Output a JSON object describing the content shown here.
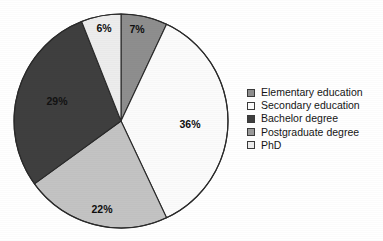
{
  "chart_data": {
    "type": "pie",
    "title": "",
    "subtitle": "",
    "xlabel": "",
    "ylabel": "",
    "legend_position": "right",
    "grid": false,
    "categories": [
      "Elementary education",
      "Secondary education",
      "Bachelor degree",
      "Postgraduate degree",
      "PhD"
    ],
    "values": [
      7,
      36,
      29,
      22,
      6
    ],
    "value_labels": [
      "7%",
      "36%",
      "29%",
      "22%",
      "6%"
    ],
    "colors": [
      "#8e8e8e",
      "#fbfbfb",
      "#3f3f3f",
      "#c3c3c3",
      "#ededed"
    ],
    "slice_order_clockwise_from_top": [
      "Elementary education",
      "Secondary education",
      "Postgraduate degree",
      "Bachelor degree",
      "PhD"
    ]
  },
  "legend": {
    "items": [
      {
        "label": "Elementary education",
        "color": "#8e8e8e",
        "value": "7%"
      },
      {
        "label": "Secondary education",
        "color": "#fdfdfd",
        "value": "36%"
      },
      {
        "label": "Bachelor degree",
        "color": "#3f3f3f",
        "value": "29%"
      },
      {
        "label": "Postgraduate degree",
        "color": "#9a9a9a",
        "value": "22%"
      },
      {
        "label": "PhD",
        "color": "#ededed",
        "value": "6%"
      }
    ]
  },
  "slice_labels": [
    {
      "text": "7%",
      "x": 137,
      "y": 29,
      "on_dark": false
    },
    {
      "text": "36%",
      "x": 190,
      "y": 124,
      "on_dark": false
    },
    {
      "text": "22%",
      "x": 102,
      "y": 209,
      "on_dark": false
    },
    {
      "text": "29%",
      "x": 57,
      "y": 101,
      "on_dark": true
    },
    {
      "text": "6%",
      "x": 104,
      "y": 28,
      "on_dark": false
    }
  ],
  "style": {
    "background": "#ffffff",
    "outline": "#2a2a2a",
    "text_color": "#151515"
  },
  "geometry": {
    "center_x": 121,
    "center_y": 121,
    "radius": 107
  }
}
